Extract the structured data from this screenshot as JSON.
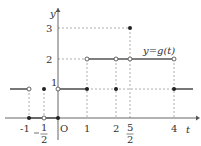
{
  "graph": {
    "function_label": "y=g(t)",
    "x_axis_label": "t",
    "y_axis_label": "y",
    "origin_label": "O",
    "x_ticks": [
      {
        "value": -1,
        "label": "-1"
      },
      {
        "value": -0.5,
        "label": "-1/2",
        "num": "1",
        "den": "2"
      },
      {
        "value": 1,
        "label": "1"
      },
      {
        "value": 2,
        "label": "2"
      },
      {
        "value": 2.5,
        "label": "5/2",
        "num": "5",
        "den": "2"
      },
      {
        "value": 4,
        "label": "4"
      }
    ],
    "y_ticks": [
      {
        "value": 1,
        "label": "1"
      },
      {
        "value": 2,
        "label": "2"
      },
      {
        "value": 3,
        "label": "3"
      }
    ],
    "segments": [
      {
        "from": null,
        "to": -1,
        "y": 1
      },
      {
        "from": -1,
        "to": 0,
        "y": 0
      },
      {
        "from": 0,
        "to": 1,
        "y": 1
      },
      {
        "from": 1,
        "to": 4,
        "y": 2
      },
      {
        "from": 4,
        "to": null,
        "y": 1
      }
    ],
    "open_points": [
      [
        -1,
        1
      ],
      [
        -0.5,
        0
      ],
      [
        0,
        1
      ],
      [
        1,
        2
      ],
      [
        2,
        2
      ],
      [
        2.5,
        2
      ],
      [
        4,
        2
      ]
    ],
    "filled_points": [
      [
        -1,
        0
      ],
      [
        -0.5,
        1
      ],
      [
        0,
        0
      ],
      [
        1,
        1
      ],
      [
        2,
        1
      ],
      [
        2.5,
        3
      ],
      [
        4,
        1
      ]
    ]
  }
}
